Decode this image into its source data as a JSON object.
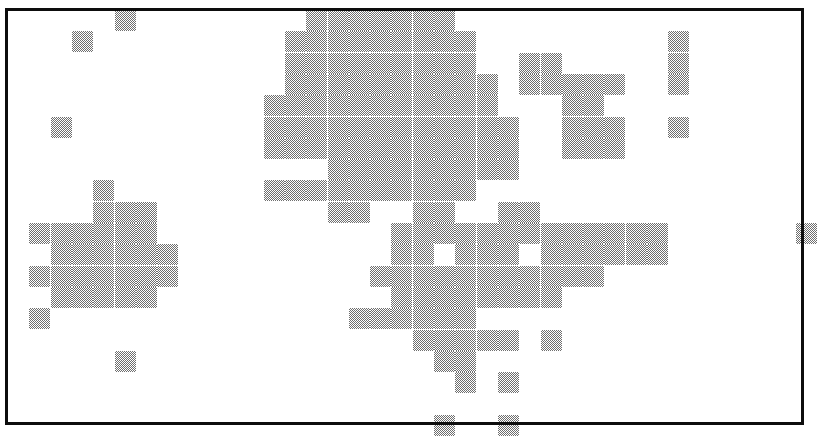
{
  "figure": {
    "title": "",
    "kind": "dithered-raster-grid-map",
    "background_color": "#ffffff",
    "frame_color": "#0d0d0d",
    "cell_fill_color": "#6e6e6e",
    "cell_empty_color": "#ffffff"
  },
  "frame": {
    "x": 5,
    "y": 8,
    "width": 799,
    "height": 417,
    "border_width": 3
  },
  "chart_data": {
    "type": "heatmap",
    "title": "",
    "subtitle": "",
    "xlabel": "",
    "ylabel": "",
    "legend": [],
    "annotations": [],
    "grid": true,
    "value_scale": {
      "0": "empty / absent",
      "1": "shaded / present"
    },
    "cell_pitch_x": 21.3,
    "cell_pitch_y": 21.3,
    "origin_x": 8,
    "origin_y": 10,
    "n_cols": 38,
    "n_rows": 20,
    "x": [
      0,
      1,
      2,
      3,
      4,
      5,
      6,
      7,
      8,
      9,
      10,
      11,
      12,
      13,
      14,
      15,
      16,
      17,
      18,
      19,
      20,
      21,
      22,
      23,
      24,
      25,
      26,
      27,
      28,
      29,
      30,
      31,
      32,
      33,
      34,
      35,
      36,
      37
    ],
    "y": [
      0,
      1,
      2,
      3,
      4,
      5,
      6,
      7,
      8,
      9,
      10,
      11,
      12,
      13,
      14,
      15,
      16,
      17,
      18,
      19
    ],
    "xlim": [
      0,
      38
    ],
    "ylim": [
      0,
      20
    ],
    "filled_cells": [
      [
        5,
        0
      ],
      [
        14,
        0
      ],
      [
        15,
        0
      ],
      [
        16,
        0
      ],
      [
        17,
        0
      ],
      [
        18,
        0
      ],
      [
        19,
        0
      ],
      [
        20,
        0
      ],
      [
        3,
        1
      ],
      [
        13,
        1
      ],
      [
        14,
        1
      ],
      [
        15,
        1
      ],
      [
        16,
        1
      ],
      [
        17,
        1
      ],
      [
        18,
        1
      ],
      [
        19,
        1
      ],
      [
        20,
        1
      ],
      [
        21,
        1
      ],
      [
        31,
        1
      ],
      [
        13,
        2
      ],
      [
        14,
        2
      ],
      [
        15,
        2
      ],
      [
        16,
        2
      ],
      [
        17,
        2
      ],
      [
        18,
        2
      ],
      [
        19,
        2
      ],
      [
        20,
        2
      ],
      [
        21,
        2
      ],
      [
        24,
        2
      ],
      [
        25,
        2
      ],
      [
        31,
        2
      ],
      [
        13,
        3
      ],
      [
        14,
        3
      ],
      [
        15,
        3
      ],
      [
        16,
        3
      ],
      [
        17,
        3
      ],
      [
        18,
        3
      ],
      [
        19,
        3
      ],
      [
        20,
        3
      ],
      [
        21,
        3
      ],
      [
        22,
        3
      ],
      [
        24,
        3
      ],
      [
        25,
        3
      ],
      [
        26,
        3
      ],
      [
        27,
        3
      ],
      [
        28,
        3
      ],
      [
        31,
        3
      ],
      [
        12,
        4
      ],
      [
        13,
        4
      ],
      [
        14,
        4
      ],
      [
        15,
        4
      ],
      [
        16,
        4
      ],
      [
        17,
        4
      ],
      [
        18,
        4
      ],
      [
        19,
        4
      ],
      [
        20,
        4
      ],
      [
        21,
        4
      ],
      [
        22,
        4
      ],
      [
        26,
        4
      ],
      [
        27,
        4
      ],
      [
        2,
        5
      ],
      [
        13,
        5
      ],
      [
        14,
        5
      ],
      [
        15,
        5
      ],
      [
        16,
        5
      ],
      [
        17,
        5
      ],
      [
        18,
        5
      ],
      [
        19,
        5
      ],
      [
        20,
        5
      ],
      [
        21,
        5
      ],
      [
        22,
        5
      ],
      [
        23,
        5
      ],
      [
        26,
        5
      ],
      [
        27,
        5
      ],
      [
        28,
        5
      ],
      [
        31,
        5
      ],
      [
        12,
        5
      ],
      [
        12,
        6
      ],
      [
        13,
        6
      ],
      [
        14,
        6
      ],
      [
        15,
        6
      ],
      [
        16,
        6
      ],
      [
        17,
        6
      ],
      [
        18,
        6
      ],
      [
        19,
        6
      ],
      [
        20,
        6
      ],
      [
        21,
        6
      ],
      [
        22,
        6
      ],
      [
        23,
        6
      ],
      [
        26,
        6
      ],
      [
        27,
        6
      ],
      [
        28,
        6
      ],
      [
        15,
        7
      ],
      [
        16,
        7
      ],
      [
        17,
        7
      ],
      [
        18,
        7
      ],
      [
        19,
        7
      ],
      [
        20,
        7
      ],
      [
        21,
        7
      ],
      [
        22,
        7
      ],
      [
        23,
        7
      ],
      [
        15,
        8
      ],
      [
        16,
        8
      ],
      [
        17,
        8
      ],
      [
        18,
        8
      ],
      [
        19,
        8
      ],
      [
        20,
        8
      ],
      [
        21,
        8
      ],
      [
        12,
        8
      ],
      [
        13,
        8
      ],
      [
        14,
        8
      ],
      [
        4,
        8
      ],
      [
        15,
        9
      ],
      [
        16,
        9
      ],
      [
        19,
        9
      ],
      [
        20,
        9
      ],
      [
        23,
        9
      ],
      [
        24,
        9
      ],
      [
        1,
        10
      ],
      [
        2,
        10
      ],
      [
        3,
        10
      ],
      [
        4,
        10
      ],
      [
        5,
        10
      ],
      [
        6,
        10
      ],
      [
        4,
        9
      ],
      [
        5,
        9
      ],
      [
        6,
        9
      ],
      [
        37,
        10
      ],
      [
        18,
        10
      ],
      [
        19,
        10
      ],
      [
        20,
        10
      ],
      [
        21,
        10
      ],
      [
        22,
        10
      ],
      [
        23,
        10
      ],
      [
        24,
        10
      ],
      [
        25,
        10
      ],
      [
        26,
        10
      ],
      [
        27,
        10
      ],
      [
        28,
        10
      ],
      [
        29,
        10
      ],
      [
        30,
        10
      ],
      [
        2,
        11
      ],
      [
        3,
        11
      ],
      [
        4,
        11
      ],
      [
        5,
        11
      ],
      [
        6,
        11
      ],
      [
        7,
        11
      ],
      [
        18,
        11
      ],
      [
        19,
        11
      ],
      [
        21,
        11
      ],
      [
        22,
        11
      ],
      [
        23,
        11
      ],
      [
        25,
        11
      ],
      [
        26,
        11
      ],
      [
        27,
        11
      ],
      [
        28,
        11
      ],
      [
        29,
        11
      ],
      [
        30,
        11
      ],
      [
        1,
        12
      ],
      [
        2,
        12
      ],
      [
        3,
        12
      ],
      [
        4,
        12
      ],
      [
        5,
        12
      ],
      [
        6,
        12
      ],
      [
        7,
        12
      ],
      [
        17,
        12
      ],
      [
        18,
        12
      ],
      [
        19,
        12
      ],
      [
        20,
        12
      ],
      [
        21,
        12
      ],
      [
        22,
        12
      ],
      [
        23,
        12
      ],
      [
        24,
        12
      ],
      [
        25,
        12
      ],
      [
        26,
        12
      ],
      [
        27,
        12
      ],
      [
        2,
        13
      ],
      [
        3,
        13
      ],
      [
        4,
        13
      ],
      [
        5,
        13
      ],
      [
        6,
        13
      ],
      [
        18,
        13
      ],
      [
        19,
        13
      ],
      [
        20,
        13
      ],
      [
        21,
        13
      ],
      [
        22,
        13
      ],
      [
        23,
        13
      ],
      [
        24,
        13
      ],
      [
        25,
        13
      ],
      [
        1,
        14
      ],
      [
        18,
        14
      ],
      [
        19,
        14
      ],
      [
        20,
        14
      ],
      [
        21,
        14
      ],
      [
        16,
        14
      ],
      [
        17,
        14
      ],
      [
        18,
        14
      ],
      [
        19,
        15
      ],
      [
        20,
        15
      ],
      [
        21,
        15
      ],
      [
        22,
        15
      ],
      [
        23,
        15
      ],
      [
        25,
        15
      ],
      [
        5,
        16
      ],
      [
        20,
        16
      ],
      [
        21,
        16
      ],
      [
        21,
        17
      ],
      [
        23,
        17
      ],
      [
        20,
        19
      ],
      [
        23,
        19
      ]
    ]
  }
}
